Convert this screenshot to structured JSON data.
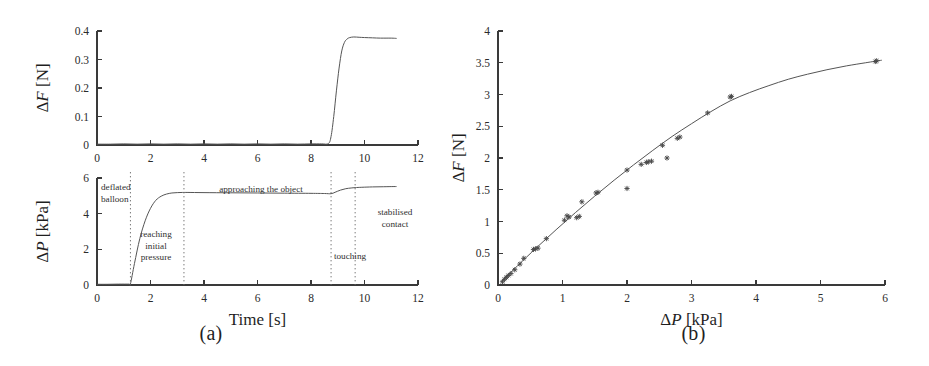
{
  "figure": {
    "panel_a_caption": "(a)",
    "panel_b_caption": "(b)"
  },
  "panel_a": {
    "top_plot": {
      "ylabel_delta": "Δ",
      "ylabel_var": "F",
      "ylabel_unit": " [N]",
      "y_ticks": [
        "0",
        "0.1",
        "0.2",
        "0.3",
        "0.4"
      ],
      "x_ticks": [
        "0",
        "2",
        "4",
        "6",
        "8",
        "10",
        "12"
      ]
    },
    "bottom_plot": {
      "ylabel_delta": "Δ",
      "ylabel_var": "P",
      "ylabel_unit": " [kPa]",
      "xlabel": "Time [s]",
      "y_ticks": [
        "0",
        "2",
        "4",
        "6"
      ],
      "x_ticks": [
        "0",
        "2",
        "4",
        "6",
        "8",
        "10",
        "12"
      ],
      "annotations": [
        {
          "id": "deflated-balloon",
          "lines": [
            "deflated",
            "balloon"
          ]
        },
        {
          "id": "reaching-initial-pressure",
          "lines": [
            "reaching",
            "initial",
            "pressure"
          ]
        },
        {
          "id": "approaching-the-object",
          "lines": [
            "approaching the object"
          ]
        },
        {
          "id": "touching",
          "lines": [
            "touching"
          ]
        },
        {
          "id": "stabilised-contact",
          "lines": [
            "stabilised",
            "contact"
          ]
        }
      ]
    }
  },
  "panel_b": {
    "ylabel_delta": "Δ",
    "ylabel_var": "F",
    "ylabel_unit": " [N]",
    "xlabel_delta": "Δ",
    "xlabel_var": "P",
    "xlabel_unit": " [kPa]",
    "y_ticks": [
      "0",
      "0.5",
      "1",
      "1.5",
      "2",
      "2.5",
      "3",
      "3.5",
      "4"
    ],
    "x_ticks": [
      "0",
      "1",
      "2",
      "3",
      "4",
      "5",
      "6"
    ]
  },
  "chart_data": [
    {
      "id": "force-vs-time",
      "type": "line",
      "title": "",
      "xlabel": "",
      "ylabel": "ΔF [N]",
      "xlim": [
        0,
        12
      ],
      "ylim": [
        0,
        0.4
      ],
      "xticks": [
        0,
        2,
        4,
        6,
        8,
        10,
        12
      ],
      "yticks": [
        0,
        0.1,
        0.2,
        0.3,
        0.4
      ],
      "grid": false,
      "legend": "none",
      "series": [
        {
          "name": "ΔF",
          "x": [
            0.0,
            0.5,
            1.0,
            1.5,
            2.0,
            2.5,
            3.0,
            3.5,
            4.0,
            4.5,
            5.0,
            5.5,
            6.0,
            6.5,
            7.0,
            7.5,
            8.0,
            8.4,
            8.65,
            8.75,
            8.85,
            8.95,
            9.05,
            9.15,
            9.25,
            9.35,
            9.45,
            9.6,
            9.8,
            10.0,
            10.3,
            10.6,
            11.0,
            11.2
          ],
          "y": [
            0.003,
            0.003,
            0.004,
            0.003,
            0.004,
            0.003,
            0.004,
            0.003,
            0.004,
            0.003,
            0.004,
            0.003,
            0.004,
            0.003,
            0.004,
            0.003,
            0.004,
            0.004,
            0.005,
            0.03,
            0.1,
            0.19,
            0.27,
            0.33,
            0.36,
            0.372,
            0.377,
            0.379,
            0.378,
            0.377,
            0.376,
            0.375,
            0.375,
            0.374
          ]
        }
      ]
    },
    {
      "id": "pressure-vs-time",
      "type": "line",
      "title": "",
      "xlabel": "Time [s]",
      "ylabel": "ΔP [kPa]",
      "xlim": [
        0,
        12
      ],
      "ylim": [
        0,
        6
      ],
      "xticks": [
        0,
        2,
        4,
        6,
        8,
        10,
        12
      ],
      "yticks": [
        0,
        2,
        4,
        6
      ],
      "grid": false,
      "legend": "none",
      "phase_boundaries": [
        1.25,
        3.25,
        8.75,
        9.65
      ],
      "phases": [
        "deflated balloon",
        "reaching initial pressure",
        "approaching the object",
        "touching",
        "stabilised contact"
      ],
      "series": [
        {
          "name": "ΔP",
          "x": [
            0.0,
            0.4,
            0.8,
            1.2,
            1.25,
            1.4,
            1.6,
            1.8,
            2.0,
            2.2,
            2.4,
            2.6,
            2.8,
            3.0,
            3.2,
            3.4,
            4.0,
            5.0,
            6.0,
            7.0,
            8.0,
            8.5,
            8.75,
            8.9,
            9.1,
            9.3,
            9.5,
            9.65,
            9.9,
            10.3,
            10.7,
            11.1,
            11.2
          ],
          "y": [
            0.04,
            0.04,
            0.05,
            0.05,
            0.06,
            1.2,
            2.6,
            3.6,
            4.3,
            4.75,
            4.98,
            5.1,
            5.16,
            5.18,
            5.19,
            5.19,
            5.18,
            5.17,
            5.16,
            5.15,
            5.14,
            5.13,
            5.12,
            5.2,
            5.32,
            5.4,
            5.44,
            5.46,
            5.48,
            5.5,
            5.51,
            5.52,
            5.52
          ]
        }
      ]
    },
    {
      "id": "force-vs-pressure",
      "type": "scatter",
      "title": "",
      "xlabel": "ΔP [kPa]",
      "ylabel": "ΔF [N]",
      "xlim": [
        0,
        6
      ],
      "ylim": [
        0,
        4
      ],
      "xticks": [
        0,
        1,
        2,
        3,
        4,
        5,
        6
      ],
      "yticks": [
        0,
        0.5,
        1,
        1.5,
        2,
        2.5,
        3,
        3.5,
        4
      ],
      "grid": false,
      "legend": "none",
      "points": [
        [
          0.07,
          0.05
        ],
        [
          0.1,
          0.09
        ],
        [
          0.13,
          0.12
        ],
        [
          0.16,
          0.15
        ],
        [
          0.2,
          0.18
        ],
        [
          0.26,
          0.24
        ],
        [
          0.34,
          0.33
        ],
        [
          0.4,
          0.42
        ],
        [
          0.55,
          0.56
        ],
        [
          0.58,
          0.57
        ],
        [
          0.62,
          0.58
        ],
        [
          0.75,
          0.73
        ],
        [
          1.03,
          1.02
        ],
        [
          1.07,
          1.09
        ],
        [
          1.1,
          1.07
        ],
        [
          1.22,
          1.06
        ],
        [
          1.26,
          1.08
        ],
        [
          1.3,
          1.31
        ],
        [
          1.52,
          1.45
        ],
        [
          1.55,
          1.46
        ],
        [
          2.0,
          1.52
        ],
        [
          2.0,
          1.81
        ],
        [
          2.22,
          1.9
        ],
        [
          2.3,
          1.93
        ],
        [
          2.33,
          1.94
        ],
        [
          2.38,
          1.95
        ],
        [
          2.55,
          2.2
        ],
        [
          2.62,
          2.0
        ],
        [
          2.78,
          2.31
        ],
        [
          2.82,
          2.33
        ],
        [
          3.25,
          2.71
        ],
        [
          3.6,
          2.96
        ],
        [
          3.62,
          2.97
        ],
        [
          5.85,
          3.52
        ],
        [
          5.87,
          3.53
        ]
      ],
      "fit_curve": {
        "name": "fitted curve",
        "x": [
          0.05,
          0.3,
          0.6,
          0.9,
          1.2,
          1.5,
          1.8,
          2.1,
          2.4,
          2.7,
          3.0,
          3.3,
          3.6,
          3.9,
          4.2,
          4.5,
          4.8,
          5.1,
          5.4,
          5.7,
          5.95
        ],
        "y": [
          0.05,
          0.3,
          0.59,
          0.87,
          1.14,
          1.4,
          1.65,
          1.89,
          2.12,
          2.34,
          2.54,
          2.73,
          2.9,
          3.03,
          3.14,
          3.24,
          3.32,
          3.39,
          3.45,
          3.5,
          3.54
        ]
      }
    }
  ]
}
